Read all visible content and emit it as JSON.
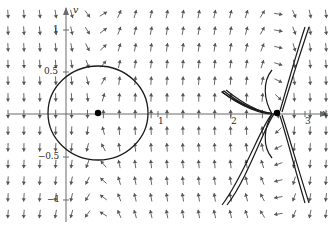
{
  "figure": {
    "type": "phase-portrait",
    "title": "",
    "background_color": "#ffffff",
    "axis_color": "#6b6b6b",
    "curve_color": "#1a1a1a",
    "arrow_color": "#555555",
    "point_color": "#000000",
    "width": 328,
    "height": 230
  },
  "axes": {
    "x_axis": {
      "name": "x",
      "label_x": 322,
      "label_y": 108,
      "y_pixel": 114,
      "x_start": 8,
      "x_end": 328,
      "ticks": [
        {
          "label": "1",
          "value": 1,
          "x": 158
        },
        {
          "label": "2",
          "value": 2,
          "x": 231
        },
        {
          "label": "3",
          "value": 3,
          "x": 305
        }
      ]
    },
    "y_axis": {
      "name": "v",
      "label_x": 73,
      "label_y": 5,
      "x_pixel": 66,
      "y_start": 8,
      "y_end": 222,
      "ticks": [
        {
          "label": "1",
          "value": 1,
          "y": 30
        },
        {
          "label": "0.5",
          "value": 0.5,
          "y": 72
        },
        {
          "label": "−0.5",
          "value": -0.5,
          "y": 157
        },
        {
          "label": "−1",
          "value": -1,
          "y": 200
        }
      ]
    },
    "origin": {
      "x": 66,
      "y": 114
    },
    "scale": {
      "x_per_unit": 73,
      "y_per_half_unit": 42.5
    }
  },
  "chart_data": {
    "type": "scatter",
    "title": "",
    "xlabel": "x",
    "ylabel": "v",
    "xlim": [
      -0.8,
      3.6
    ],
    "ylim": [
      -1.25,
      1.25
    ],
    "grid": false,
    "legend": null,
    "equilibria": [
      {
        "name": "center",
        "x": 0.44,
        "y": 0.0,
        "px": 98,
        "py": 113,
        "kind": "center"
      },
      {
        "name": "saddle",
        "x": 2.89,
        "y": 0.0,
        "px": 277,
        "py": 113,
        "kind": "saddle"
      }
    ],
    "closed_orbit": {
      "center_px": [
        98,
        113
      ],
      "radius_px": [
        50,
        47
      ],
      "description": "periodic orbit around the center"
    },
    "separatrices": {
      "description": "saddle separatrix branches forming an X through the saddle point"
    },
    "direction_field": {
      "description": "grid of normalized arrows showing flow direction",
      "columns": 21,
      "rows": 13
    }
  },
  "labels": {
    "x_axis_name": "x",
    "y_axis_name": "v",
    "tick_1_y": "1",
    "tick_05_y": "0.5",
    "tick_neg05_y": "−0.5",
    "tick_neg1_y": "−1",
    "tick_1_x": "1",
    "tick_2_x": "2",
    "tick_3_x": "3"
  }
}
